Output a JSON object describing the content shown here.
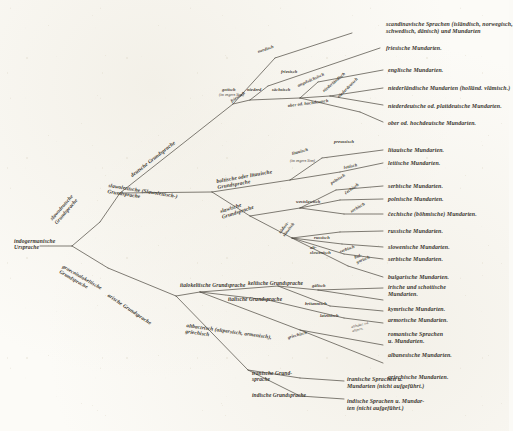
{
  "figure": {
    "kind": "stammbaum",
    "ink_color": "#3a362f",
    "line_color": "#4a463e",
    "paper_color": "#fcfbf7"
  },
  "root": {
    "label": "indogermanische\nUrsprache"
  },
  "nodes": {
    "slawodeutsch": "slawodeutsche\nGrundsprache",
    "graecoitalokeltisch": "graecoitalokeltische\nGrundsprache",
    "slawolettisch": "slawolettische (Slawolettisch-)\nGrundsprache",
    "deutsch": "deutsche Grundsprache",
    "baltisch": "baltische oder litauische\nGrundsprache",
    "slawisch": "slawische\nGrundsprache",
    "italokeltisch": "italokeltische Grundsprache",
    "arisch": "arische Grundsprache",
    "keltisch": "keltische Grundsprache",
    "italisch": "italische Grundsprache",
    "altbaktrisch": "altbactrisch (altpersisch, armenisch),\ngriechisch",
    "iranisch": "iranische Grund-\nsprache",
    "indisch": "indische Grundsprache",
    "nordisch": "nordisch",
    "gotisch": "gotisch",
    "gotisch_note": "(im engern Sinn)",
    "friesisch": "friesisch",
    "niederd": "niederd",
    "saechsisch": "sächsisch",
    "angelsaechsisch": "angelsächsisch",
    "niederlaendisch": "niederländisch",
    "niederdeutsch2": "niederdeutsch",
    "oberhochdeutsch": "ober od. hochdeutsch",
    "litauisch": "litauisch",
    "litauisch_note": "(im engern Sinn)",
    "lettisch": "lettisch",
    "preussisch": "preussisch",
    "westslawisch": "westslawisch",
    "suedostslawisch": "südost-\nslawisch",
    "polnisch": "polnisch",
    "cechisch": "čechisch",
    "serbisch_w": "serbisch",
    "russisch": "russisch",
    "altslowenisch": "alt-\nslowenisch",
    "serbisch_s": "serbisch",
    "bulgarisch": "bul-\ngarisch",
    "gaelisch": "gälisch",
    "britannisch": "britannisch",
    "lateinisch": "lateinisch",
    "griechisch": "griechisch",
    "altbaktrisch_s": "altbaktr. od.\naltpers."
  },
  "leaves": [
    {
      "id": "nordgerm",
      "label": "scandinavische Sprachen (isländisch, norwegisch,\nschwedisch, dänisch) und Mundarten"
    },
    {
      "id": "fries",
      "label": "friesische Mundarten."
    },
    {
      "id": "engl",
      "label": "englische Mundarten."
    },
    {
      "id": "nl",
      "label": "niederländische Mundarten (holländ. vlämisch.)"
    },
    {
      "id": "platt",
      "label": "niederdeutsche od. plattdeutsche Mundarten."
    },
    {
      "id": "hochd",
      "label": "ober od. hochdeutsche Mundarten."
    },
    {
      "id": "lit",
      "label": "litauische Mundarten."
    },
    {
      "id": "lett",
      "label": "lettische Mundarten."
    },
    {
      "id": "serbw",
      "label": "serbische Mundarten."
    },
    {
      "id": "poln",
      "label": "polnische Mundarten."
    },
    {
      "id": "cech",
      "label": "čechische (böhmische) Mundarten."
    },
    {
      "id": "russ",
      "label": "russische Mundarten."
    },
    {
      "id": "slowen",
      "label": "slowenische Mundarten."
    },
    {
      "id": "serbs",
      "label": "serbische Mundarten."
    },
    {
      "id": "bulg",
      "label": "bulgarische Mundarten."
    },
    {
      "id": "irsch",
      "label": "irische und schottische\nMundarten."
    },
    {
      "id": "kymr",
      "label": "kymrische Mundarten."
    },
    {
      "id": "armor",
      "label": "armorische Mundarten."
    },
    {
      "id": "roman",
      "label": "romanische Sprachen\nu. Mundarten."
    },
    {
      "id": "alban",
      "label": "albanesische Mundarten."
    },
    {
      "id": "griech",
      "label": "griechische Mundarten."
    },
    {
      "id": "iran",
      "label": "iranische Sprachen u.\nMundarten (nicht aufgeführt.)"
    },
    {
      "id": "ind",
      "label": "indische Sprachen u. Mundar-\nten (nicht aufgeführt.)"
    }
  ]
}
